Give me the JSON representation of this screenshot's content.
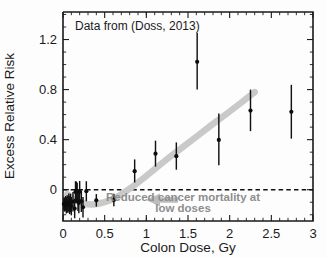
{
  "chart_data": {
    "type": "scatter",
    "title": "Data from (Doss, 2013)",
    "xlabel": "Colon Dose, Gy",
    "ylabel": "Excess Relative Risk",
    "xlim": [
      0,
      3
    ],
    "ylim": [
      -0.25,
      1.42
    ],
    "grid": false,
    "legend": "none",
    "xticks": [
      "0",
      "0.5",
      "1",
      "1.5",
      "2",
      "2.5",
      "3"
    ],
    "xtick_values": [
      0,
      0.5,
      1,
      1.5,
      2,
      2.5,
      3
    ],
    "yticks": [
      "0",
      "0.4",
      "0.8",
      "1.2"
    ],
    "ytick_values": [
      0,
      0.4,
      0.8,
      1.2
    ],
    "reference_line": {
      "y": 0,
      "style": "dashed"
    },
    "annotation": {
      "line1": "Reduced cancer mortality at",
      "line2": "low doses",
      "arrow": "left-arrow-icon"
    },
    "points": [
      {
        "x": 0.01,
        "y": -0.115,
        "ylo": -0.165,
        "yhi": -0.065
      },
      {
        "x": 0.02,
        "y": -0.12,
        "ylo": -0.175,
        "yhi": -0.062
      },
      {
        "x": 0.03,
        "y": -0.108,
        "ylo": -0.168,
        "yhi": -0.05
      },
      {
        "x": 0.04,
        "y": -0.125,
        "ylo": -0.19,
        "yhi": -0.06
      },
      {
        "x": 0.05,
        "y": -0.112,
        "ylo": -0.18,
        "yhi": -0.045
      },
      {
        "x": 0.06,
        "y": -0.118,
        "ylo": -0.185,
        "yhi": -0.052
      },
      {
        "x": 0.07,
        "y": -0.1,
        "ylo": -0.172,
        "yhi": -0.03
      },
      {
        "x": 0.08,
        "y": -0.122,
        "ylo": -0.195,
        "yhi": -0.05
      },
      {
        "x": 0.09,
        "y": -0.105,
        "ylo": -0.18,
        "yhi": -0.032
      },
      {
        "x": 0.1,
        "y": -0.13,
        "ylo": -0.205,
        "yhi": -0.058
      },
      {
        "x": 0.12,
        "y": -0.095,
        "ylo": -0.175,
        "yhi": -0.018
      },
      {
        "x": 0.14,
        "y": -0.15,
        "ylo": -0.228,
        "yhi": -0.072
      },
      {
        "x": 0.15,
        "y": -0.018,
        "ylo": -0.105,
        "yhi": 0.068
      },
      {
        "x": 0.16,
        "y": -0.02,
        "ylo": -0.108,
        "yhi": 0.065
      },
      {
        "x": 0.17,
        "y": -0.01,
        "ylo": -0.075,
        "yhi": 0.055
      },
      {
        "x": 0.18,
        "y": -0.088,
        "ylo": -0.17,
        "yhi": -0.005
      },
      {
        "x": 0.19,
        "y": -0.105,
        "ylo": -0.188,
        "yhi": -0.022
      },
      {
        "x": 0.2,
        "y": -0.016,
        "ylo": -0.1,
        "yhi": 0.07
      },
      {
        "x": 0.22,
        "y": -0.092,
        "ylo": -0.178,
        "yhi": -0.008
      },
      {
        "x": 0.24,
        "y": -0.14,
        "ylo": -0.222,
        "yhi": -0.058
      },
      {
        "x": 0.28,
        "y": -0.012,
        "ylo": -0.092,
        "yhi": 0.068
      },
      {
        "x": 0.4,
        "y": -0.085,
        "ylo": -0.135,
        "yhi": -0.035
      },
      {
        "x": 0.61,
        "y": -0.082,
        "ylo": -0.132,
        "yhi": -0.032
      },
      {
        "x": 0.86,
        "y": 0.148,
        "ylo": 0.058,
        "yhi": 0.242
      },
      {
        "x": 1.11,
        "y": 0.288,
        "ylo": 0.185,
        "yhi": 0.392
      },
      {
        "x": 1.36,
        "y": 0.268,
        "ylo": 0.16,
        "yhi": 0.378
      },
      {
        "x": 1.61,
        "y": 1.022,
        "ylo": 0.8,
        "yhi": 1.252
      },
      {
        "x": 1.87,
        "y": 0.398,
        "ylo": 0.195,
        "yhi": 0.608
      },
      {
        "x": 2.25,
        "y": 0.632,
        "ylo": 0.468,
        "yhi": 0.8
      },
      {
        "x": 2.74,
        "y": 0.622,
        "ylo": 0.408,
        "yhi": 0.838
      }
    ],
    "trend_curve": [
      {
        "x": 0.05,
        "y": -0.035
      },
      {
        "x": 0.14,
        "y": -0.08
      },
      {
        "x": 0.24,
        "y": -0.108
      },
      {
        "x": 0.36,
        "y": -0.118
      },
      {
        "x": 0.5,
        "y": -0.1
      },
      {
        "x": 0.64,
        "y": -0.062
      },
      {
        "x": 0.8,
        "y": 0.008
      },
      {
        "x": 1.0,
        "y": 0.11
      },
      {
        "x": 1.25,
        "y": 0.245
      },
      {
        "x": 1.5,
        "y": 0.372
      },
      {
        "x": 1.75,
        "y": 0.5
      },
      {
        "x": 2.0,
        "y": 0.625
      },
      {
        "x": 2.3,
        "y": 0.78
      }
    ]
  },
  "colors": {
    "marker": "#0d0d0d",
    "trend": "#c9c9c9",
    "annotation": "#8e8e8e",
    "axis": "#1a1a1a",
    "background": "#fdfdfd"
  }
}
